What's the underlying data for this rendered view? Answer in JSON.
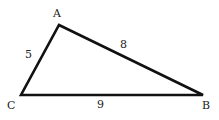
{
  "diagram": {
    "type": "triangle",
    "vertices": [
      {
        "name": "A",
        "x": 59,
        "y": 25
      },
      {
        "name": "B",
        "x": 203,
        "y": 95
      },
      {
        "name": "C",
        "x": 21,
        "y": 95
      }
    ],
    "labels": {
      "A": "A",
      "B": "B",
      "C": "C"
    },
    "sides": {
      "AC": "5",
      "AB": "8",
      "CB": "9"
    },
    "stroke_color": "#111111"
  }
}
